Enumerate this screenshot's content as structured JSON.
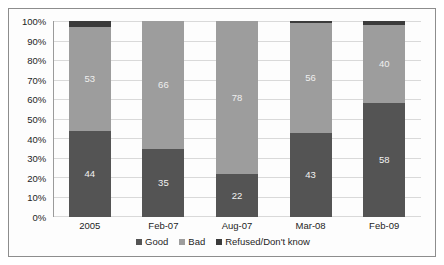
{
  "chart_data": {
    "type": "bar",
    "title": "",
    "subtitle": "",
    "xlabel": "",
    "ylabel": "",
    "stacked": true,
    "normalized_percent": true,
    "grid": true,
    "legend_position": "bottom",
    "ylim": [
      0,
      100
    ],
    "y_ticks": [
      "0%",
      "10%",
      "20%",
      "30%",
      "40%",
      "50%",
      "60%",
      "70%",
      "80%",
      "90%",
      "100%"
    ],
    "categories": [
      "2005",
      "Feb-07",
      "Aug-07",
      "Mar-08",
      "Feb-09"
    ],
    "series": [
      {
        "name": "Good",
        "color": "#545454",
        "values": [
          44,
          35,
          22,
          43,
          58
        ],
        "labels": [
          "44",
          "35",
          "22",
          "43",
          "58"
        ]
      },
      {
        "name": "Bad",
        "color": "#9d9d9d",
        "values": [
          53,
          66,
          78,
          56,
          40
        ],
        "labels": [
          "53",
          "66",
          "78",
          "56",
          "40"
        ]
      },
      {
        "name": "Refused/Don't know",
        "color": "#3b3b3b",
        "values": [
          3,
          0,
          0,
          1,
          2
        ],
        "labels": [
          "",
          "",
          "",
          "",
          ""
        ]
      }
    ]
  },
  "legend": {
    "items": [
      {
        "label": "Good",
        "color": "#545454"
      },
      {
        "label": "Bad",
        "color": "#9d9d9d"
      },
      {
        "label": "Refused/Don't know",
        "color": "#3b3b3b"
      }
    ]
  }
}
